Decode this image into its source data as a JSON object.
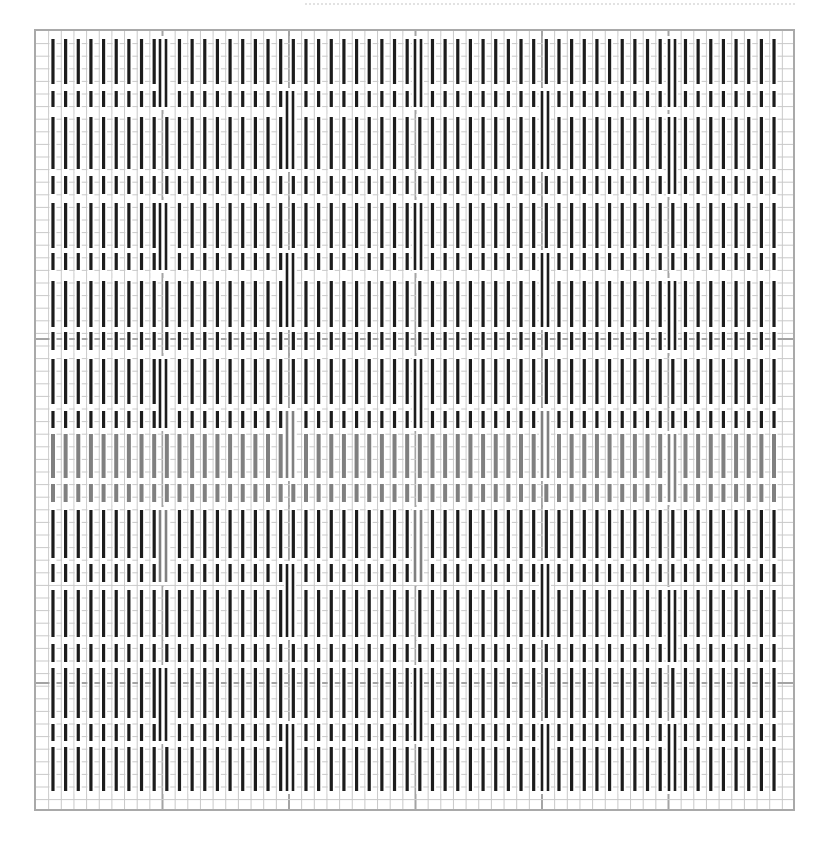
{
  "chart_title": "",
  "grid": {
    "columns": 60,
    "rows": 62,
    "cell_w": 12.65,
    "cell_h": 12.6,
    "major_every": 10,
    "minor_color": "#c9c9c9",
    "major_color": "#a4a4a4",
    "border_color": "#a9a9a9",
    "major_row_lines_y": [
      308,
      652
    ]
  },
  "stitch": {
    "color_dark": "#1c1c1c",
    "color_gray": "#808080",
    "width": 3.2,
    "first_column": 1,
    "last_column": 58
  },
  "bands": [
    {
      "y1": 8,
      "y2": 53,
      "kind": "long",
      "color": "dark"
    },
    {
      "y1": 60,
      "y2": 76,
      "kind": "short",
      "color": "dark"
    },
    {
      "y1": 86,
      "y2": 138,
      "kind": "long",
      "color": "dark"
    },
    {
      "y1": 145,
      "y2": 163,
      "kind": "short",
      "color": "dark"
    },
    {
      "y1": 172,
      "y2": 217,
      "kind": "long",
      "color": "dark"
    },
    {
      "y1": 222,
      "y2": 239,
      "kind": "short",
      "color": "dark"
    },
    {
      "y1": 250,
      "y2": 296,
      "kind": "long",
      "color": "dark"
    },
    {
      "y1": 301,
      "y2": 319,
      "kind": "short",
      "color": "dark"
    },
    {
      "y1": 328,
      "y2": 373,
      "kind": "long",
      "color": "dark"
    },
    {
      "y1": 380,
      "y2": 397,
      "kind": "short",
      "color": "dark"
    },
    {
      "y1": 403,
      "y2": 447,
      "kind": "long",
      "color": "gray"
    },
    {
      "y1": 453,
      "y2": 471,
      "kind": "short",
      "color": "gray"
    },
    {
      "y1": 479,
      "y2": 527,
      "kind": "long",
      "color": "dark"
    },
    {
      "y1": 533,
      "y2": 551,
      "kind": "short",
      "color": "dark"
    },
    {
      "y1": 559,
      "y2": 606,
      "kind": "long",
      "color": "dark"
    },
    {
      "y1": 613,
      "y2": 631,
      "kind": "short",
      "color": "dark"
    },
    {
      "y1": 637,
      "y2": 687,
      "kind": "long",
      "color": "dark"
    },
    {
      "y1": 693,
      "y2": 710,
      "kind": "short",
      "color": "dark"
    },
    {
      "y1": 716,
      "y2": 760,
      "kind": "long",
      "color": "dark"
    }
  ],
  "doubled_stitches": [
    {
      "x": 128,
      "segments": [
        [
          8,
          76
        ],
        [
          172,
          239
        ],
        [
          328,
          397
        ],
        [
          479,
          551,
          "gray"
        ],
        [
          637,
          710
        ]
      ]
    },
    {
      "x": 255,
      "segments": [
        [
          60,
          138
        ],
        [
          222,
          296
        ],
        [
          380,
          447,
          "gray"
        ],
        [
          533,
          606
        ],
        [
          693,
          760
        ]
      ]
    },
    {
      "x": 383,
      "segments": [
        [
          8,
          76
        ],
        [
          172,
          239
        ],
        [
          328,
          397
        ],
        [
          479,
          551,
          "gray"
        ],
        [
          637,
          710
        ]
      ]
    },
    {
      "x": 510,
      "segments": [
        [
          60,
          138
        ],
        [
          222,
          296
        ],
        [
          380,
          447,
          "gray"
        ],
        [
          533,
          606
        ],
        [
          693,
          760
        ]
      ]
    },
    {
      "x": 637,
      "segments": [
        [
          8,
          76
        ],
        [
          86,
          163
        ],
        [
          250,
          319
        ],
        [
          403,
          471,
          "gray"
        ],
        [
          559,
          631
        ],
        [
          693,
          760
        ]
      ]
    }
  ]
}
